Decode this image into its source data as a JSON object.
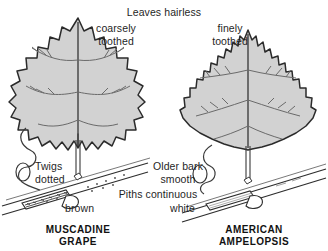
{
  "plate": {
    "title": "Leaves hairless",
    "background_color": "#ffffff",
    "ink_color": "#1f1f1f",
    "leaf_fill_color": "#d2d2d2",
    "leaf_outline_color": "#2b2b2b",
    "vein_color": "#5e5e5e"
  },
  "headers": {
    "shared": "Leaves hairless"
  },
  "left": {
    "species_line1": "MUSCADINE",
    "species_line2": "GRAPE",
    "leaf_margin_line1": "coarsely",
    "leaf_margin_line2": "toothed",
    "twig_line1": "Twigs",
    "twig_line2": "dotted",
    "pith_color": "brown",
    "leaf_shape_name": "rounded-coarsely-toothed-leaf",
    "tendril_name": "coiled-tendril"
  },
  "right": {
    "species_line1": "AMERICAN",
    "species_line2": "AMPELOPSIS",
    "leaf_margin_line1": "finely",
    "leaf_margin_line2": "toothed",
    "bark_line1": "Older bark",
    "bark_line2": "smooth",
    "pith_color": "white",
    "leaf_shape_name": "heart-shaped-finely-toothed-leaf",
    "tendril_name": "coiled-tendril"
  },
  "shared": {
    "pith_label": "Piths continuous"
  }
}
